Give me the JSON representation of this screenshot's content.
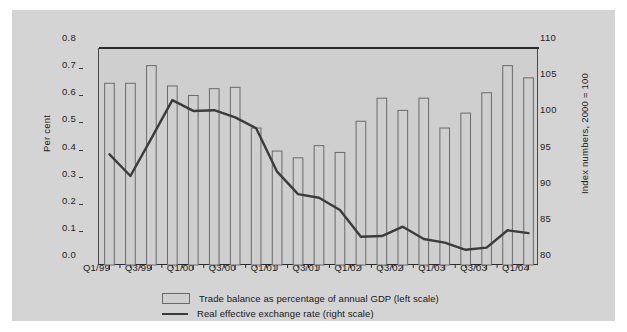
{
  "figure": {
    "background_color": "#d4d4d4",
    "plot_background_color": "#cfcfcf",
    "rule_color": "#1a1a1a"
  },
  "axes": {
    "left": {
      "label": "Per cent",
      "ticks": [
        "0.8",
        "0.7",
        "0.6",
        "0.5",
        "0.4",
        "0.3",
        "0.2",
        "0.1",
        "0.0"
      ],
      "min": 0.0,
      "max": 0.8
    },
    "right": {
      "label": "Index numbers, 2000 = 100",
      "ticks": [
        "110",
        "105",
        "100",
        "95",
        "90",
        "85",
        "80"
      ],
      "min": 80,
      "max": 110
    },
    "bottom": {
      "ticks": [
        "Q1/99",
        "Q3/99",
        "Q1/00",
        "Q3/00",
        "Q1/01",
        "Q3/01",
        "Q1/02",
        "Q3/02",
        "Q1/03",
        "Q3/03",
        "Q1/04"
      ]
    }
  },
  "legend": {
    "position": "bottom-center",
    "items": [
      {
        "marker": "bar-swatch",
        "label": "Trade balance as percentage of annual GDP (left scale)"
      },
      {
        "marker": "line-swatch",
        "label": "Real effective exchange rate (right scale)"
      }
    ]
  },
  "chart_data": {
    "type": "bar",
    "title": "",
    "xlabel": "",
    "ylabel": "Per cent",
    "y2label": "Index numbers, 2000 = 100",
    "ylim": [
      0.0,
      0.8
    ],
    "y2lim": [
      80,
      110
    ],
    "grid": false,
    "legend_position": "bottom-center",
    "categories": [
      "Q1/99",
      "Q2/99",
      "Q3/99",
      "Q4/99",
      "Q1/00",
      "Q2/00",
      "Q3/00",
      "Q4/00",
      "Q1/01",
      "Q2/01",
      "Q3/01",
      "Q4/01",
      "Q1/02",
      "Q2/02",
      "Q3/02",
      "Q4/02",
      "Q1/03",
      "Q2/03",
      "Q3/03",
      "Q4/03",
      "Q1/04"
    ],
    "series": [
      {
        "name": "Trade balance as percentage of annual GDP (left scale)",
        "type": "bar",
        "axis": "left",
        "color": "#cfcfcf",
        "edge_color": "#6a6a6a",
        "values": [
          0.67,
          0.67,
          0.735,
          0.66,
          0.625,
          0.65,
          0.655,
          0.505,
          0.42,
          0.395,
          0.44,
          0.415,
          0.53,
          0.615,
          0.57,
          0.615,
          0.505,
          0.56,
          0.635,
          0.735,
          0.69
        ]
      },
      {
        "name": "Real effective exchange rate (right scale)",
        "type": "line",
        "axis": "right",
        "color": "#3c3c3c",
        "values": [
          95.3,
          92.3,
          97.5,
          102.8,
          101.3,
          101.4,
          100.4,
          98.9,
          92.9,
          89.8,
          89.3,
          87.6,
          83.9,
          84.0,
          85.3,
          83.6,
          83.1,
          82.1,
          82.4,
          84.8,
          84.4
        ]
      }
    ]
  }
}
